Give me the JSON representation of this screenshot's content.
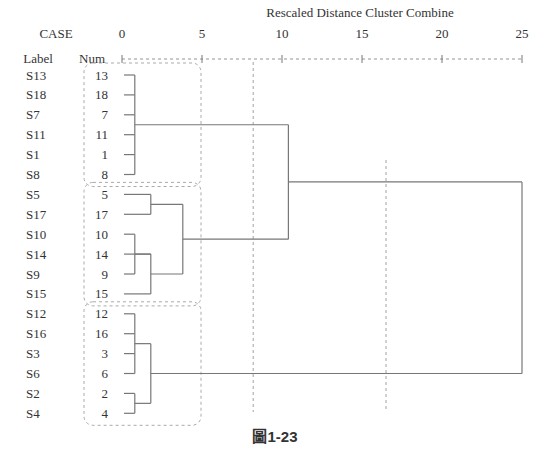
{
  "chart_data": {
    "type": "dendrogram",
    "title": "Rescaled Distance Cluster Combine",
    "header_case": "CASE",
    "header_label": "Label",
    "header_num": "Num",
    "xlim": [
      0,
      25
    ],
    "xticks": [
      "0",
      "5",
      "10",
      "15",
      "20",
      "25"
    ],
    "xtick_values": [
      0,
      5,
      10,
      15,
      20,
      25
    ],
    "leaves": [
      {
        "label": "S13",
        "num": "13"
      },
      {
        "label": "S18",
        "num": "18"
      },
      {
        "label": "S7",
        "num": "7"
      },
      {
        "label": "S11",
        "num": "11"
      },
      {
        "label": "S1",
        "num": "1"
      },
      {
        "label": "S8",
        "num": "8"
      },
      {
        "label": "S5",
        "num": "5"
      },
      {
        "label": "S17",
        "num": "17"
      },
      {
        "label": "S10",
        "num": "10"
      },
      {
        "label": "S14",
        "num": "14"
      },
      {
        "label": "S9",
        "num": "9"
      },
      {
        "label": "S15",
        "num": "15"
      },
      {
        "label": "S12",
        "num": "12"
      },
      {
        "label": "S16",
        "num": "16"
      },
      {
        "label": "S3",
        "num": "3"
      },
      {
        "label": "S6",
        "num": "6"
      },
      {
        "label": "S2",
        "num": "2"
      },
      {
        "label": "S4",
        "num": "4"
      }
    ],
    "merges": [
      {
        "id": "A",
        "children": [
          "L0",
          "L1",
          "L2",
          "L3",
          "L4",
          "L5"
        ],
        "distance": 0.8
      },
      {
        "id": "B",
        "children": [
          "L6",
          "L7"
        ],
        "distance": 1.8
      },
      {
        "id": "C",
        "children": [
          "L8",
          "L10"
        ],
        "distance": 0.8
      },
      {
        "id": "D",
        "children": [
          "C",
          "L9",
          "L11"
        ],
        "distance": 1.8
      },
      {
        "id": "E",
        "children": [
          "B",
          "D"
        ],
        "distance": 3.8
      },
      {
        "id": "F",
        "children": [
          "L12",
          "L13",
          "L14",
          "L15"
        ],
        "distance": 0.8
      },
      {
        "id": "G",
        "children": [
          "L16",
          "L17"
        ],
        "distance": 0.8
      },
      {
        "id": "H",
        "children": [
          "F",
          "G"
        ],
        "distance": 1.8
      },
      {
        "id": "I",
        "children": [
          "A",
          "E"
        ],
        "distance": 10.4
      },
      {
        "id": "J",
        "children": [
          "I",
          "H"
        ],
        "distance": 25
      }
    ],
    "cut_lines": [
      8.2,
      16.5
    ],
    "cluster_groups": [
      [
        "S13",
        "S18",
        "S7",
        "S11",
        "S1",
        "S8"
      ],
      [
        "S5",
        "S17",
        "S10",
        "S14",
        "S9",
        "S15"
      ],
      [
        "S12",
        "S16",
        "S3",
        "S6",
        "S2",
        "S4"
      ]
    ],
    "caption": "圖1-23"
  }
}
